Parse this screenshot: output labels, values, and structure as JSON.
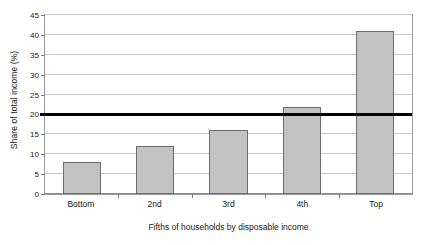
{
  "chart_data": {
    "type": "bar",
    "title": "",
    "subtitle": "",
    "categories": [
      "Bottom",
      "2nd",
      "3rd",
      "4th",
      "Top"
    ],
    "values": [
      8,
      12,
      16,
      22,
      41
    ],
    "xlabel": "Fifths of households by disposable income",
    "ylabel": "Share of total income (%)",
    "ylim": [
      0,
      45
    ],
    "ytick_step": 5,
    "yticks": [
      0,
      5,
      10,
      15,
      20,
      25,
      30,
      35,
      40,
      45
    ],
    "ytick_labels": [
      "0",
      "5",
      "10",
      "15",
      "20",
      "25",
      "30",
      "35",
      "40",
      "45"
    ],
    "grid": true,
    "legend": false,
    "annotations": [
      {
        "name": "equal-share-reference-line",
        "type": "horizontal-line",
        "value": 20,
        "style": "thick-black"
      }
    ],
    "series": [
      {
        "name": "Share of total income",
        "values": [
          8,
          12,
          16,
          22,
          41
        ],
        "color": "#C2C2C2",
        "edge_color": "#6D6D6D"
      }
    ]
  },
  "colors": {
    "background": "#FFFFFF",
    "bar_fill": "#C2C2C2",
    "bar_edge": "#6D6D6D",
    "gridline": "#C9C9C9",
    "axis": "#9A9A9A",
    "reference_line": "#000000",
    "text": "#1A1A1A"
  }
}
